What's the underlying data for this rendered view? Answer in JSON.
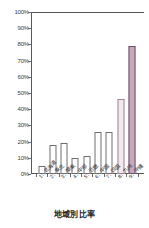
{
  "chart_data": {
    "type": "bar",
    "title": "",
    "xlabel": "地域別比率",
    "ylabel": "",
    "ylim": [
      0,
      100
    ],
    "grid": true,
    "legend": "none",
    "categories": [
      "1：北海道",
      "2：東北",
      "3：関東",
      "4：中部",
      "5：近畿",
      "6：中国",
      "7：四国",
      "8：九州",
      "9：沖縄"
    ],
    "values": [
      5,
      18,
      19,
      10,
      11,
      26,
      26,
      46,
      79
    ],
    "value_unit": "%",
    "ytick_labels": [
      "100%",
      "90%",
      "80%",
      "70%",
      "60%",
      "50%",
      "40%",
      "30%",
      "20%",
      "10%",
      "0%"
    ],
    "ytick_values": [
      100,
      90,
      80,
      70,
      60,
      50,
      40,
      30,
      20,
      10,
      0
    ],
    "series": [
      {
        "name": "地域別比率",
        "values": [
          5,
          18,
          19,
          10,
          11,
          26,
          26,
          46,
          79
        ]
      }
    ],
    "bar_styles": [
      "plain",
      "plain",
      "plain",
      "plain",
      "plain",
      "plain",
      "plain",
      "tint-a",
      "tint-b"
    ],
    "colors": {
      "bar_fill_default": "#ffffff",
      "bar_border_default": "#6e6e6e",
      "bar_fill_highlight_light": "#f2e8ee",
      "bar_border_highlight_light": "#9b8294",
      "bar_fill_highlight_strong": "#c6a9bd",
      "bar_border_highlight_strong": "#6d4f62",
      "gridline": "#d2d2d2",
      "axis": "#595959",
      "text": "#2e2e2e",
      "background": "#ffffff"
    }
  }
}
